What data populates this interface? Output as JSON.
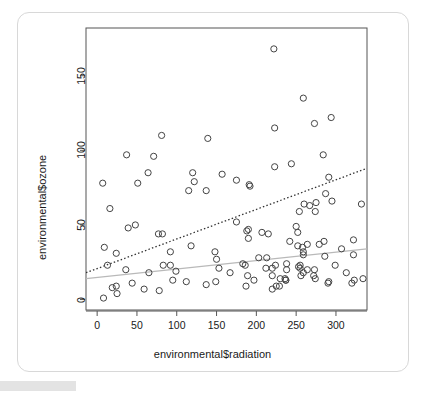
{
  "figure": {
    "device_background": "#ffffff",
    "frame_color": "#d8d8d8"
  },
  "chart_data": {
    "type": "scatter",
    "title": "",
    "xlabel": "environmental$radiation",
    "ylabel": "environmental$ozone",
    "xlim": [
      -14,
      339
    ],
    "ylim": [
      -7,
      182
    ],
    "xticks": [
      0,
      50,
      100,
      150,
      200,
      250,
      300
    ],
    "xtick_labels": [
      "0",
      "50",
      "100",
      "150",
      "200",
      "250",
      "300"
    ],
    "yticks": [
      0,
      50,
      100,
      150
    ],
    "ytick_labels": [
      "0",
      "50",
      "100",
      "150"
    ],
    "grid": false,
    "legend": "none",
    "point_marker": "open-circle",
    "point_color": "#444444",
    "point_radius_px": 3.1,
    "series": [
      {
        "name": "ozone vs radiation",
        "x": [
          190,
          118,
          149,
          313,
          299,
          99,
          19,
          256,
          290,
          274,
          65,
          334,
          307,
          78,
          322,
          44,
          8,
          320,
          25,
          92,
          13,
          252,
          223,
          279,
          286,
          287,
          242,
          186,
          220,
          264,
          273,
          291,
          323,
          259,
          250,
          148,
          332,
          322,
          191,
          284,
          37,
          120,
          137,
          150,
          59,
          39,
          9,
          16,
          122,
          267,
          272,
          175,
          139,
          264,
          175,
          291,
          48,
          260,
          274,
          285,
          187,
          220,
          7,
          258,
          295,
          294,
          223,
          81,
          82,
          213,
          275,
          253,
          254,
          83,
          24,
          77,
          255,
          229,
          207,
          222,
          137,
          192,
          273,
          157,
          64,
          71,
          51,
          115,
          244,
          190,
          259,
          36,
          255,
          212,
          238,
          215,
          153,
          203,
          225,
          237,
          188,
          167,
          197,
          183,
          189,
          95,
          92,
          252,
          220,
          230,
          259,
          236,
          259,
          238,
          24,
          112,
          237,
          224
        ],
        "y": [
          41,
          36,
          12,
          18,
          23,
          19,
          8,
          16,
          11,
          14,
          18,
          14,
          34,
          6,
          30,
          11,
          1,
          11,
          4,
          32,
          23,
          45,
          115,
          37,
          29,
          71,
          39,
          23,
          21,
          37,
          20,
          12,
          13,
          135,
          49,
          32,
          64,
          40,
          77,
          97,
          97,
          85,
          10,
          27,
          7,
          48,
          35,
          61,
          79,
          63,
          16,
          80,
          108,
          20,
          52,
          82,
          50,
          64,
          59,
          39,
          9,
          16,
          78,
          35,
          66,
          122,
          89,
          110,
          44,
          28,
          65,
          22,
          59,
          23,
          31,
          44,
          21,
          9,
          45,
          168,
          73,
          76,
          118,
          84,
          85,
          96,
          78,
          73,
          91,
          47,
          32,
          20,
          23,
          21,
          24,
          44,
          21,
          28,
          9,
          13,
          46,
          18,
          13,
          24,
          16,
          13,
          23,
          36,
          7,
          14,
          30,
          14,
          18,
          20,
          9,
          12,
          13,
          23
        ]
      }
    ],
    "lines": [
      {
        "name": "least-squares-fit-dotted",
        "style": "dotted",
        "color": "#333333",
        "width_px": 1.3,
        "x_start": -14,
        "y_start": 18,
        "x_end": 339,
        "y_end": 88
      },
      {
        "name": "resistant-fit-solid",
        "style": "solid",
        "color": "#b9b9b9",
        "width_px": 1.2,
        "x_start": -14,
        "y_start": 14,
        "x_end": 339,
        "y_end": 34
      }
    ]
  }
}
